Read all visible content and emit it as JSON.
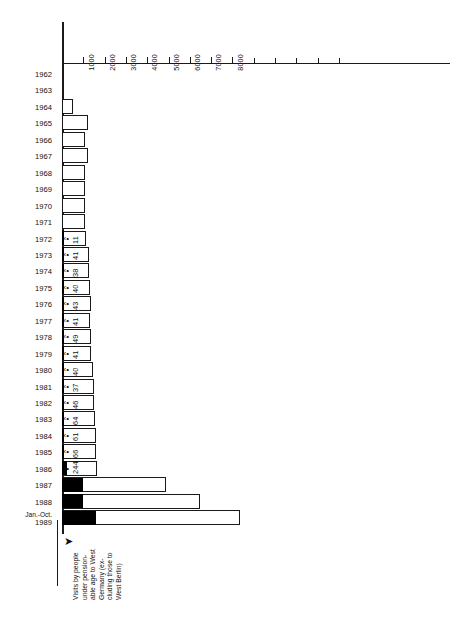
{
  "chart_data": {
    "type": "bar",
    "orientation": "horizontal",
    "title": "",
    "subtitle": "",
    "xlabel": "",
    "ylabel": "",
    "xlim": [
      0,
      9000
    ],
    "xticks": [
      1000,
      2000,
      3000,
      4000,
      5000,
      6000,
      7000,
      8000
    ],
    "xtick_labels": [
      "1000",
      "2000",
      "3000",
      "4000",
      "5000",
      "6000",
      "7000",
      "8000"
    ],
    "minor_xticks": [
      9000,
      10000,
      11000,
      12000,
      13000
    ],
    "grid": false,
    "legend": "none",
    "categories": [
      "1962",
      "1963",
      "1964",
      "1965",
      "1966",
      "1967",
      "1968",
      "1969",
      "1970",
      "1971",
      "1972",
      "1973",
      "1974",
      "1975",
      "1976",
      "1977",
      "1978",
      "1979",
      "1980",
      "1981",
      "1982",
      "1983",
      "1984",
      "1985",
      "1986",
      "1987",
      "1988",
      "Jan.-Oct. 1989"
    ],
    "series": [
      {
        "name": "Total visits",
        "values": [
          10,
          40,
          520,
          1210,
          1100,
          1220,
          1070,
          1070,
          1070,
          1100,
          1110,
          1280,
          1280,
          1330,
          1350,
          1330,
          1370,
          1370,
          1450,
          1500,
          1500,
          1540,
          1580,
          1600,
          1620,
          4900,
          6500,
          8350
        ]
      },
      {
        "name": "Visits by people under pensionable age",
        "values": [
          null,
          null,
          null,
          null,
          null,
          null,
          null,
          null,
          null,
          null,
          11,
          41,
          38,
          40,
          43,
          41,
          49,
          41,
          40,
          37,
          46,
          64,
          61,
          66,
          244,
          1000,
          1000,
          1600
        ],
        "labels": [
          "",
          "",
          "",
          "",
          "",
          "",
          "",
          "",
          "",
          "",
          "11",
          "41",
          "38",
          "40",
          "43",
          "41",
          "49",
          "41",
          "40",
          "37",
          "46",
          "64",
          "61",
          "66",
          "244",
          "",
          "",
          ""
        ]
      }
    ],
    "annotation": {
      "text": "Visits by people under pension-able age to West Germany (excluding those to West Berlin)",
      "lines": [
        "Visits by people",
        "under pension-",
        "able age to West",
        "Germany (ex-",
        "cluding those to",
        "West Berlin)"
      ],
      "pointer": "arrow-up-icon"
    },
    "colors": {
      "axis": "#1a1a1a",
      "bar_outline": "#1a1a1a",
      "bar_fill": "#ffffff",
      "inner_fill": "#000000",
      "text": "#111111"
    }
  }
}
